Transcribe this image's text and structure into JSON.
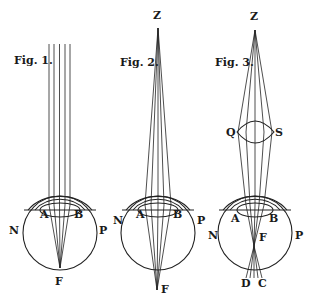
{
  "figures": [
    {
      "title": "Fig. 1.",
      "title_pos": [
        14,
        64
      ],
      "eye": {
        "cx": 60,
        "cy": 233,
        "r": 37
      },
      "labels": {
        "A": {
          "text": "A",
          "x": 40,
          "y": 218
        },
        "B": {
          "text": "B",
          "x": 74,
          "y": 218
        },
        "N": {
          "text": "N",
          "x": 9,
          "y": 234
        },
        "P": {
          "text": "P",
          "x": 99,
          "y": 234
        },
        "F": {
          "text": "F",
          "x": 55,
          "y": 285
        }
      },
      "source": "parallel rays",
      "focus": [
        60,
        268
      ]
    },
    {
      "title": "Fig. 2.",
      "title_pos": [
        120,
        66
      ],
      "apex_label": {
        "text": "Z",
        "x": 153,
        "y": 19
      },
      "eye": {
        "cx": 158,
        "cy": 233,
        "r": 37
      },
      "labels": {
        "A": {
          "text": "A",
          "x": 136,
          "y": 218
        },
        "B": {
          "text": "B",
          "x": 173,
          "y": 218
        },
        "N": {
          "text": "N",
          "x": 113,
          "y": 224
        },
        "P": {
          "text": "P",
          "x": 197,
          "y": 224
        },
        "F": {
          "text": "F",
          "x": 161,
          "y": 293
        }
      },
      "source": "diverging rays from Z",
      "focus": [
        157,
        290
      ]
    },
    {
      "title": "Fig. 3.",
      "title_pos": [
        215,
        66
      ],
      "apex_label": {
        "text": "Z",
        "x": 250,
        "y": 20
      },
      "lens_labels": {
        "Q": {
          "text": "Q",
          "x": 226,
          "y": 136
        },
        "S": {
          "text": "S",
          "x": 275,
          "y": 136
        }
      },
      "eye": {
        "cx": 255,
        "cy": 233,
        "r": 37
      },
      "labels": {
        "A": {
          "text": "A",
          "x": 231,
          "y": 222
        },
        "B": {
          "text": "B",
          "x": 269,
          "y": 222
        },
        "N": {
          "text": "N",
          "x": 208,
          "y": 239
        },
        "P": {
          "text": "P",
          "x": 295,
          "y": 239
        },
        "F": {
          "text": "F",
          "x": 259,
          "y": 241
        },
        "D": {
          "text": "D",
          "x": 241,
          "y": 287
        },
        "C": {
          "text": "C",
          "x": 258,
          "y": 287
        }
      },
      "source": "rays from Z through convex lens QS",
      "focus": [
        254,
        246
      ]
    }
  ]
}
